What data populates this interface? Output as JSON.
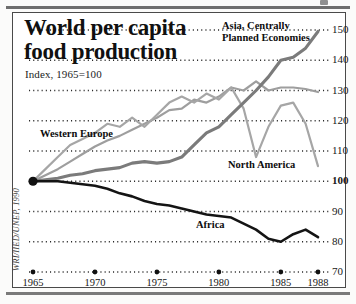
{
  "figure": {
    "title": "World per capita\nfood production",
    "title_line1": "World per capita",
    "title_line2": "food production",
    "subtitle": "Index, 1965=100",
    "credit": "WRI/IIED/UNEP, 1990"
  },
  "labels": {
    "asia": "Asia, Centrally Planned Economies",
    "western_europe": "Western Europe",
    "north_america": "North America",
    "africa": "Africa"
  },
  "colors": {
    "asia": "#7b7b7b",
    "western_europe": "#9e9e9e",
    "north_america": "#a6a6a6",
    "africa": "#141414",
    "grid": "#2b2b2b",
    "frame": "#4a4a4a",
    "rule": "#6e6e6e"
  },
  "chart_data": {
    "type": "line",
    "title": "World per capita food production",
    "subtitle": "Index, 1965=100",
    "xlabel": "",
    "ylabel": "Index, 1965=100",
    "xlim": [
      1965,
      1988
    ],
    "ylim": [
      70,
      150
    ],
    "yticks": [
      70,
      80,
      90,
      100,
      110,
      120,
      130,
      140,
      150
    ],
    "ytick_labels": [
      "70",
      "80",
      "90",
      "100",
      "110",
      "120",
      "130",
      "140",
      "150"
    ],
    "ytick_bold": [
      "100"
    ],
    "xticks": [
      1965,
      1970,
      1975,
      1980,
      1985,
      1988
    ],
    "xtick_labels": [
      "1965",
      "1970",
      "1975",
      "1980",
      "1985",
      "1988"
    ],
    "grid": "horizontal-dotted",
    "legend": "inline-annotations",
    "x": [
      1965,
      1966,
      1967,
      1968,
      1969,
      1970,
      1971,
      1972,
      1973,
      1974,
      1975,
      1976,
      1977,
      1978,
      1979,
      1980,
      1981,
      1982,
      1983,
      1984,
      1985,
      1986,
      1987,
      1988
    ],
    "series": [
      {
        "name": "Asia, Centrally Planned Economies",
        "color": "#7b7b7b",
        "values": [
          100,
          100.5,
          101,
          102,
          102.5,
          103.5,
          104,
          104.5,
          106,
          106.5,
          106,
          106.5,
          108,
          112,
          116,
          118,
          122,
          126,
          130,
          134.5,
          140,
          141,
          144,
          149.5
        ]
      },
      {
        "name": "Western Europe",
        "color": "#9e9e9e",
        "values": [
          100,
          102,
          104,
          106.5,
          109,
          111.5,
          113.5,
          115,
          117,
          119,
          121,
          123.5,
          124,
          127,
          126,
          128,
          131,
          130,
          133,
          130,
          131,
          131,
          130.5,
          129.5
        ]
      },
      {
        "name": "North America",
        "color": "#a6a6a6",
        "values": [
          100,
          104,
          108,
          112,
          114,
          116,
          119,
          118,
          121,
          118,
          122,
          126,
          128,
          126,
          129,
          127,
          131,
          124,
          108,
          118,
          125,
          126,
          119,
          105
        ]
      },
      {
        "name": "Africa",
        "color": "#141414",
        "values": [
          100,
          100,
          100,
          99.5,
          99,
          98.5,
          97.5,
          96,
          95,
          93.5,
          92.5,
          92,
          91,
          90,
          89,
          88.5,
          88,
          86,
          84,
          81,
          80,
          82.5,
          84,
          81.5
        ]
      }
    ]
  }
}
